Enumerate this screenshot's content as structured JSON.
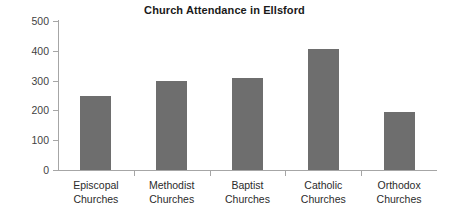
{
  "chart_data": {
    "type": "bar",
    "title": "Church Attendance in Ellsford",
    "xlabel": "",
    "ylabel": "",
    "categories": [
      "Episcopal Churches",
      "Methodist Churches",
      "Baptist Churches",
      "Catholic Churches",
      "Orthodox Churches"
    ],
    "category_lines": [
      [
        "Episcopal",
        "Churches"
      ],
      [
        "Methodist",
        "Churches"
      ],
      [
        "Baptist",
        "Churches"
      ],
      [
        "Catholic",
        "Churches"
      ],
      [
        "Orthodox",
        "Churches"
      ]
    ],
    "values": [
      250,
      300,
      310,
      405,
      195
    ],
    "ylim": [
      0,
      500
    ],
    "yticks": [
      0,
      100,
      200,
      300,
      400,
      500
    ],
    "ytick_labels": [
      "0",
      "100",
      "200",
      "300",
      "400",
      "500"
    ],
    "grid": false,
    "legend": null,
    "bar_color": "#6e6e6e",
    "axis_color": "#a6a6a6",
    "title_color": "#1a1a1a"
  }
}
